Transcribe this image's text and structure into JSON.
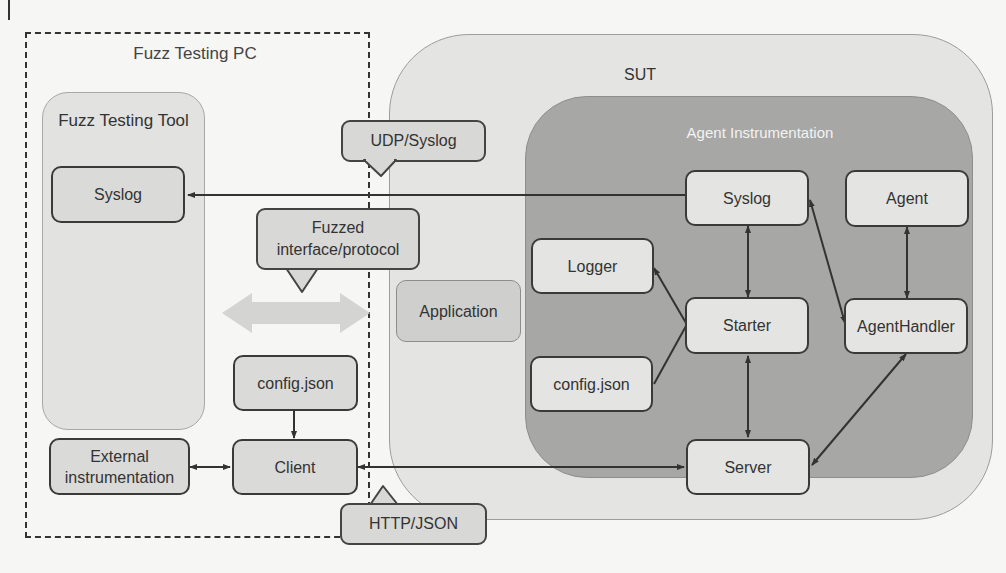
{
  "diagram": {
    "fuzz_testing_pc": {
      "label": "Fuzz Testing PC",
      "tool": {
        "label": "Fuzz Testing Tool",
        "syslog": "Syslog",
        "external_instrumentation": "External instrumentation"
      },
      "config": "config.json",
      "client": "Client"
    },
    "callouts": {
      "udp": "UDP/Syslog",
      "fuzzed": "Fuzzed interface/protocol",
      "http": "HTTP/JSON"
    },
    "sut": {
      "label": "SUT",
      "application": "Application",
      "agent_instrumentation": {
        "label": "Agent Instrumentation",
        "syslog": "Syslog",
        "agent": "Agent",
        "logger": "Logger",
        "starter": "Starter",
        "agent_handler": "AgentHandler",
        "config": "config.json",
        "server": "Server"
      }
    },
    "connections": [
      {
        "from": "Agent Syslog",
        "to": "Tool Syslog",
        "type": "arrow"
      },
      {
        "from": "Starter",
        "to": "Syslog",
        "type": "bidirectional"
      },
      {
        "from": "Starter",
        "to": "Logger",
        "type": "arrow"
      },
      {
        "from": "config.json",
        "to": "Starter",
        "type": "arrow"
      },
      {
        "from": "Starter",
        "to": "Server",
        "type": "bidirectional"
      },
      {
        "from": "AgentHandler",
        "to": "Syslog",
        "type": "bidirectional"
      },
      {
        "from": "AgentHandler",
        "to": "Agent",
        "type": "bidirectional"
      },
      {
        "from": "Server",
        "to": "AgentHandler",
        "type": "bidirectional"
      },
      {
        "from": "Client",
        "to": "Server",
        "type": "bidirectional"
      },
      {
        "from": "Client",
        "to": "External instrumentation",
        "type": "bidirectional"
      },
      {
        "from": "config.json",
        "to": "Client",
        "type": "arrow"
      },
      {
        "from": "Fuzz Testing Tool",
        "to": "Application",
        "type": "fuzzed-bidirectional"
      }
    ],
    "colors": {
      "background": "#f6f6f4",
      "panel": "#e2e2e0",
      "agent_instrumentation": "#a7a7a5",
      "box": "#dadad8",
      "stroke": "#3a3a3a",
      "fuzz_arrow": "#d4d4d2"
    }
  }
}
